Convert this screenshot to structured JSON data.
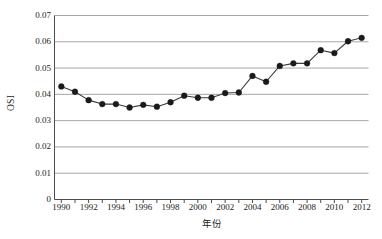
{
  "chart_data": {
    "type": "line",
    "title": "",
    "xlabel": "年份",
    "ylabel": "OSI",
    "xlim": [
      1989.5,
      2012.5
    ],
    "ylim": [
      0,
      0.07
    ],
    "grid": true,
    "legend": false,
    "marker": "filled-circle",
    "line_color": "#3a3a3a",
    "marker_color": "#1a1a1a",
    "grid_color": "#a6a6a6",
    "x": [
      1990,
      1991,
      1992,
      1993,
      1994,
      1995,
      1996,
      1997,
      1998,
      1999,
      2000,
      2001,
      2002,
      2003,
      2004,
      2005,
      2006,
      2007,
      2008,
      2009,
      2010,
      2011,
      2012
    ],
    "values": [
      0.043,
      0.041,
      0.0378,
      0.0363,
      0.0363,
      0.035,
      0.036,
      0.0353,
      0.037,
      0.0395,
      0.0387,
      0.0387,
      0.0405,
      0.0407,
      0.047,
      0.0448,
      0.0508,
      0.0518,
      0.0518,
      0.0568,
      0.0557,
      0.0602,
      0.0615
    ],
    "ytick_values": [
      0,
      0.01,
      0.02,
      0.03,
      0.04,
      0.05,
      0.06,
      0.07
    ],
    "ytick_labels": [
      "0",
      "0.01",
      "0.02",
      "0.03",
      "0.04",
      "0.05",
      "0.06",
      "0.07"
    ],
    "xtick_values": [
      1990,
      1992,
      1994,
      1996,
      1998,
      2000,
      2002,
      2004,
      2006,
      2008,
      2010,
      2012
    ],
    "xtick_labels": [
      "1990",
      "1992",
      "1994",
      "1996",
      "1998",
      "2000",
      "2002",
      "2004",
      "2006",
      "2008",
      "2010",
      "2012"
    ],
    "xtick_minor_values": [
      1991,
      1993,
      1995,
      1997,
      1999,
      2001,
      2003,
      2005,
      2007,
      2009,
      2011
    ]
  }
}
